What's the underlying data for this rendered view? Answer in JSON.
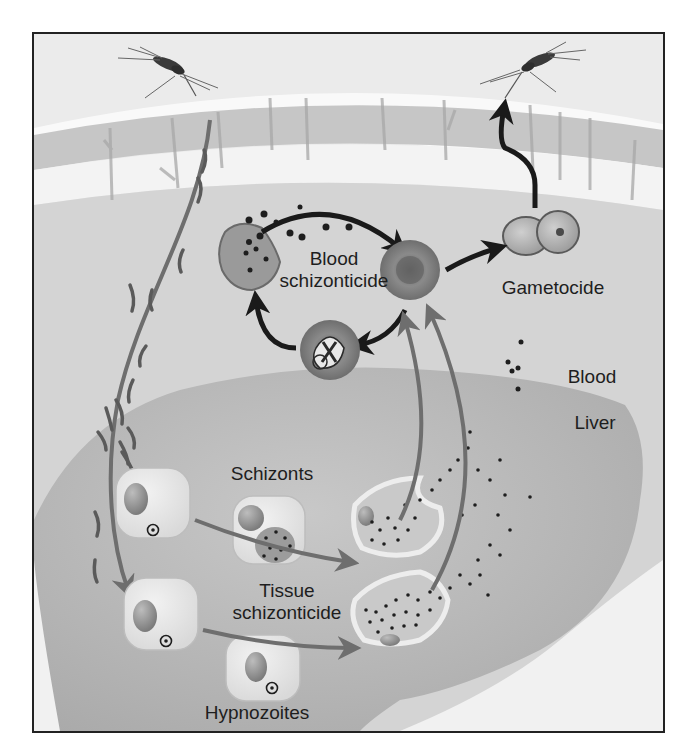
{
  "diagram": {
    "type": "malaria-parasite-life-cycle",
    "palette": {
      "frame": "#222222",
      "sky": "#ececec",
      "skin_band": "#c9c9c9",
      "skin_light": "#f1f1f1",
      "blood_region": "#d6d6d6",
      "liver": "#b7b7b7",
      "arrow_dark": "#1a1a1a",
      "arrow_gray": "#6e6e6e",
      "text": "#1e1e1e"
    },
    "labels": {
      "blood_schizonticide_line1": "Blood",
      "blood_schizonticide_line2": "schizonticide",
      "gametocide": "Gametocide",
      "blood": "Blood",
      "liver": "Liver",
      "schizonts": "Schizonts",
      "tissue_schizonticide_line1": "Tissue",
      "tissue_schizonticide_line2": "schizonticide",
      "hypnozoites": "Hypnozoites"
    },
    "nodes": [
      {
        "id": "mosquito-biting",
        "region": "skin",
        "desc": "mosquito injecting sporozoites"
      },
      {
        "id": "mosquito-feeding",
        "region": "skin",
        "desc": "mosquito taking up gametocytes"
      },
      {
        "id": "ruptured-rbc",
        "region": "blood",
        "desc": "ruptured red blood cell releasing merozoites"
      },
      {
        "id": "red-blood-cell",
        "region": "blood",
        "desc": "uninfected red blood cell"
      },
      {
        "id": "ring-stage-rbc",
        "region": "blood",
        "desc": "infected red blood cell with trophozoite"
      },
      {
        "id": "gametocytes",
        "region": "blood",
        "desc": "male and female gametocytes"
      },
      {
        "id": "hepatocyte-1",
        "region": "liver",
        "desc": "infected liver cell"
      },
      {
        "id": "hepatocyte-2",
        "region": "liver",
        "desc": "infected liver cell"
      },
      {
        "id": "schizont-cell",
        "region": "liver",
        "desc": "liver schizont"
      },
      {
        "id": "hypnozoite-cell",
        "region": "liver",
        "desc": "dormant hypnozoite"
      },
      {
        "id": "ruptured-hepatocyte-1",
        "region": "liver",
        "desc": "merozoite release"
      },
      {
        "id": "ruptured-hepatocyte-2",
        "region": "liver",
        "desc": "merozoite release"
      }
    ],
    "edges": [
      {
        "from": "mosquito-biting",
        "to": "hepatocyte-2",
        "style": "gray"
      },
      {
        "from": "hepatocyte-1",
        "to": "ruptured-hepatocyte-1",
        "style": "gray"
      },
      {
        "from": "hepatocyte-2",
        "to": "ruptured-hepatocyte-2",
        "style": "gray"
      },
      {
        "from": "ruptured-hepatocyte-1",
        "to": "red-blood-cell",
        "style": "gray"
      },
      {
        "from": "ruptured-hepatocyte-2",
        "to": "red-blood-cell",
        "style": "gray"
      },
      {
        "from": "ruptured-rbc",
        "to": "red-blood-cell",
        "style": "dark"
      },
      {
        "from": "red-blood-cell",
        "to": "ring-stage-rbc",
        "style": "dark"
      },
      {
        "from": "ring-stage-rbc",
        "to": "ruptured-rbc",
        "style": "dark"
      },
      {
        "from": "red-blood-cell",
        "to": "gametocytes",
        "style": "dark"
      },
      {
        "from": "gametocytes",
        "to": "mosquito-feeding",
        "style": "dark"
      }
    ]
  }
}
